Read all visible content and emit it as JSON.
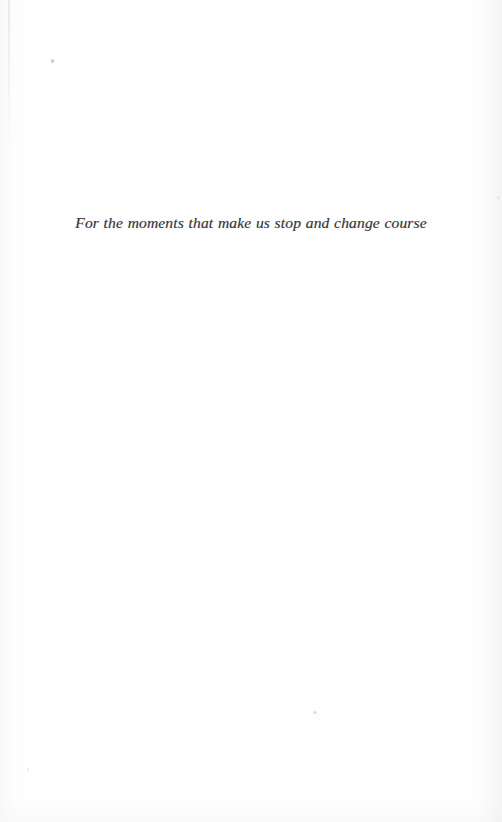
{
  "document": {
    "kind": "book-dedication-page",
    "page_background_color": "#fffefe",
    "ink_color": "#3a3a3c"
  },
  "dedication": {
    "text": "For the moments that make us stop and change course"
  },
  "artifacts": {
    "streak_name": "scan-streak",
    "speck_names": [
      "scan-speck-upper-left",
      "scan-speck-lower-center",
      "scan-speck-lower-left",
      "scan-speck-right-edge"
    ]
  }
}
